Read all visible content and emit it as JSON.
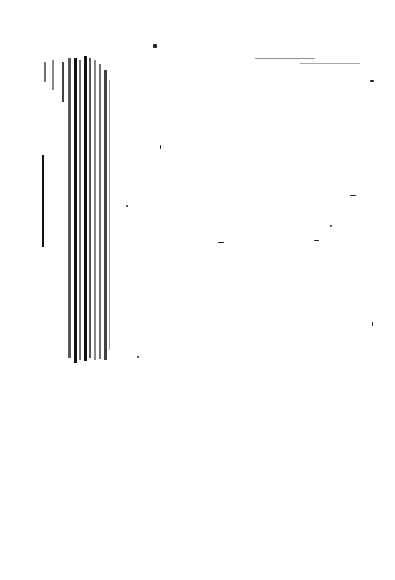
{
  "document": {
    "type": "degraded-scan",
    "legible_text": "",
    "header_fragment": "",
    "header_right_fragment": ""
  }
}
